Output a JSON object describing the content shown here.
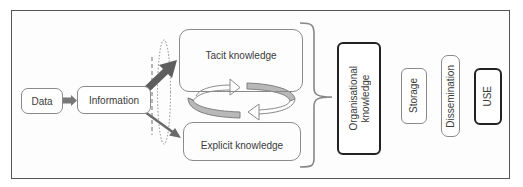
{
  "diagram": {
    "nodes": {
      "data": "Data",
      "information": "Information",
      "tacit": "Tacit knowledge",
      "explicit": "Explicit knowledge",
      "organisational_line1": "Organisational",
      "organisational_line2": "knowledge",
      "storage": "Storage",
      "dissemination": "Dissemination",
      "use": "USE"
    },
    "colors": {
      "frame": "#555555",
      "box_border": "#8a8a8a",
      "bold_border": "#222222",
      "arrow_dark": "#666666",
      "ring_fill": "#b5b5b5"
    }
  }
}
